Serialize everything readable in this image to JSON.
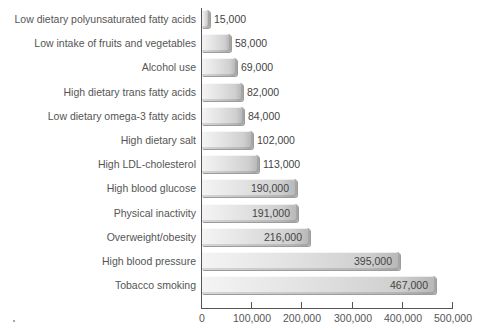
{
  "chart_data": {
    "type": "bar",
    "orientation": "horizontal",
    "title": "",
    "xlabel": "",
    "ylabel": "",
    "xlim": [
      0,
      500000
    ],
    "xticks": [
      "0",
      "100,000",
      "200,000",
      "300,000",
      "400,000",
      "500,000"
    ],
    "grid": false,
    "legend": null,
    "categories": [
      "Low dietary polyunsaturated fatty acids",
      "Low intake of fruits and vegetables",
      "Alcohol use",
      "High dietary trans fatty acids",
      "Low dietary omega-3 fatty acids",
      "High dietary salt",
      "High LDL-cholesterol",
      "High blood glucose",
      "Physical inactivity",
      "Overweight/obesity",
      "High blood pressure",
      "Tobacco smoking"
    ],
    "values": [
      15000,
      58000,
      69000,
      82000,
      84000,
      102000,
      113000,
      190000,
      191000,
      216000,
      395000,
      467000
    ],
    "value_labels": [
      "15,000",
      "58,000",
      "69,000",
      "82,000",
      "84,000",
      "102,000",
      "113,000",
      "190,000",
      "191,000",
      "216,000",
      "395,000",
      "467,000"
    ]
  }
}
